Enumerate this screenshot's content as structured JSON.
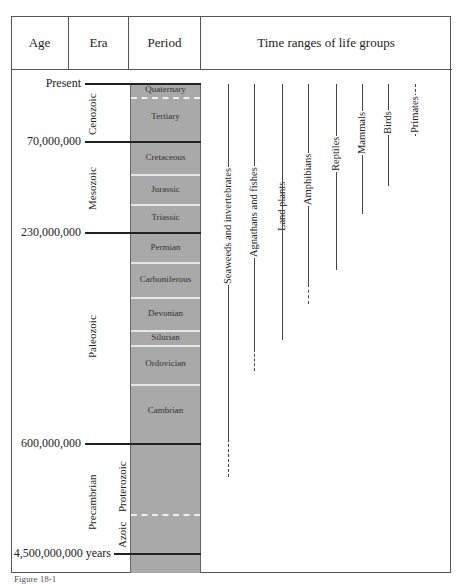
{
  "header": {
    "age": "Age",
    "era": "Era",
    "period": "Period",
    "life": "Time ranges of life groups"
  },
  "ages": {
    "present": "Present",
    "a70": "70,000,000",
    "a230": "230,000,000",
    "a600": "600,000,000",
    "a4500": "4,500,000,000 years"
  },
  "eras": {
    "cenozoic": "Cenozoic",
    "mesozoic": "Mesozoic",
    "paleozoic": "Paleozoic",
    "precambrian": "Precambrian",
    "proterozoic": "Proterozoic",
    "azoic": "Azoic"
  },
  "periods": {
    "quaternary": "Quaternary",
    "tertiary": "Tertiary",
    "cretaceous": "Cretaceous",
    "jurassic": "Jurassic",
    "triassic": "Triassic",
    "permian": "Permian",
    "carboniferous": "Carboniferous",
    "devonian": "Devonian",
    "silurian": "Silurian",
    "ordovician": "Ordovician",
    "cambrian": "Cambrian"
  },
  "life_groups": [
    {
      "name": "Seaweeds and invertebrates"
    },
    {
      "name": "Agnathans and fishes"
    },
    {
      "name": "Land plants"
    },
    {
      "name": "Amphibians"
    },
    {
      "name": "Reptiles"
    },
    {
      "name": "Mammals"
    },
    {
      "name": "Birds"
    },
    {
      "name": "Primates"
    }
  ],
  "caption": "Figure 18-1"
}
